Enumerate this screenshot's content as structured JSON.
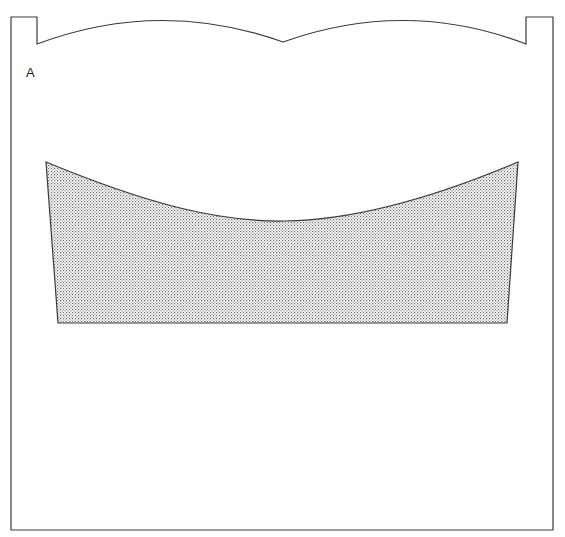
{
  "figure": {
    "label": "A",
    "colors": {
      "stroke": "#3a3a3a",
      "fill_dot": "#6a6a6a",
      "background": "#ffffff"
    },
    "frame": {
      "left": 11,
      "right": 553,
      "top": 17,
      "bottom": 530,
      "left_tab_right": 37,
      "right_tab_left": 526,
      "notch_y": 44,
      "scallop_center": [
        283,
        42
      ]
    },
    "shaded_region": {
      "pattern": "stipple",
      "top_left": [
        46,
        162
      ],
      "top_right": [
        518,
        162
      ],
      "bottom_left": [
        58,
        323
      ],
      "bottom_right": [
        507,
        323
      ],
      "curve_low_point": [
        285,
        221
      ]
    }
  }
}
